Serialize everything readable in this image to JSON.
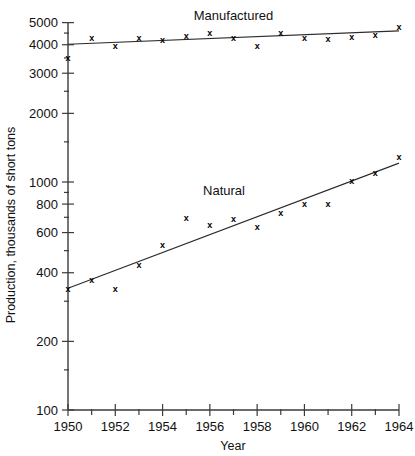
{
  "chart_data": {
    "type": "scatter",
    "title": "",
    "xlabel": "Year",
    "ylabel": "Production, thousands of short tons",
    "yscale": "log",
    "xlim": [
      1950,
      1964
    ],
    "ylim": [
      100,
      5000
    ],
    "grid": false,
    "legend_position": "inline-annotation",
    "x_ticks": [
      1950,
      1952,
      1954,
      1956,
      1958,
      1960,
      1962,
      1964
    ],
    "x_tick_labels": [
      "1950",
      "1952",
      "1954",
      "1956",
      "1958",
      "1960",
      "1962",
      "1964"
    ],
    "x_minor_ticks": [
      1951,
      1953,
      1955,
      1957,
      1959,
      1961,
      1963
    ],
    "y_ticks": [
      100,
      200,
      400,
      600,
      800,
      1000,
      2000,
      3000,
      4000,
      5000
    ],
    "y_tick_labels": [
      "100",
      "200",
      "400",
      "600",
      "800",
      "1000",
      "2000",
      "3000",
      "4000",
      "5000"
    ],
    "y_minor_ticks": [
      150,
      300,
      500,
      700,
      900,
      1500,
      2500,
      3500,
      4500
    ],
    "marker_symbol": "x",
    "x": [
      1950,
      1951,
      1952,
      1953,
      1954,
      1955,
      1956,
      1957,
      1958,
      1959,
      1960,
      1961,
      1962,
      1963,
      1964
    ],
    "series": [
      {
        "name": "Manufactured",
        "label": "Manufactured",
        "label_x": 1957.0,
        "label_y": 5150,
        "values": [
          3500,
          4300,
          3950,
          4300,
          4200,
          4400,
          4500,
          4300,
          3980,
          4500,
          4280,
          4250,
          4350,
          4420,
          4780
        ],
        "trendline": {
          "start_x": 1950,
          "start_y": 4020,
          "end_x": 1964,
          "end_y": 4600
        }
      },
      {
        "name": "Natural",
        "label": "Natural",
        "label_x": 1956.6,
        "label_y": 880,
        "values": [
          340,
          372,
          340,
          435,
          530,
          700,
          650,
          690,
          640,
          735,
          800,
          805,
          1010,
          1100,
          1290
        ],
        "trendline": {
          "start_x": 1950,
          "start_y": 342,
          "end_x": 1964,
          "end_y": 1210
        }
      }
    ]
  },
  "axes": {
    "x_title": "Year",
    "y_title": "Production, thousands of short tons"
  }
}
